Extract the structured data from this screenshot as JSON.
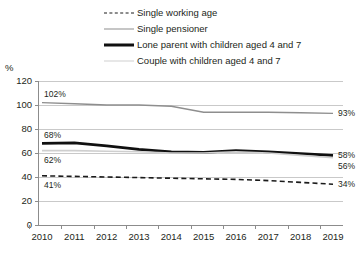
{
  "unit_label": "%",
  "legend": {
    "items": [
      {
        "label": "Single working age",
        "style": "dashed",
        "color": "#1b1b1b"
      },
      {
        "label": "Single pensioner",
        "style": "thin",
        "color": "#8e8e8e"
      },
      {
        "label": "Lone parent with children aged 4 and 7",
        "style": "thick",
        "color": "#101010"
      },
      {
        "label": "Couple with children aged 4 and 7",
        "style": "light",
        "color": "#cfcfcf"
      }
    ]
  },
  "axis": {
    "y_ticks": [
      "120",
      "100",
      "80",
      "60",
      "40",
      "20",
      "0"
    ],
    "x_ticks": [
      "2010",
      "2011",
      "2012",
      "2013",
      "2014",
      "2015",
      "2016",
      "2017",
      "2018",
      "2019"
    ]
  },
  "annotations": {
    "left": [
      {
        "text": "102%",
        "series": "Single pensioner"
      },
      {
        "text": "68%",
        "series": "Lone parent with children aged 4 and 7"
      },
      {
        "text": "62%",
        "series": "Couple with children aged 4 and 7"
      },
      {
        "text": "41%",
        "series": "Single working age"
      }
    ],
    "right": [
      {
        "text": "93%",
        "series": "Single pensioner"
      },
      {
        "text": "58%",
        "series": "Lone parent with children aged 4 and 7"
      },
      {
        "text": "56%",
        "series": "Couple with children aged 4 and 7"
      },
      {
        "text": "34%",
        "series": "Single working age"
      }
    ]
  },
  "chart_data": {
    "type": "line",
    "title": "",
    "xlabel": "",
    "ylabel": "%",
    "categories": [
      "2010",
      "2011",
      "2012",
      "2013",
      "2014",
      "2015",
      "2016",
      "2017",
      "2018",
      "2019"
    ],
    "ylim": [
      0,
      120
    ],
    "ytick_step": 20,
    "grid": "horizontal",
    "legend_position": "top",
    "series": [
      {
        "name": "Single working age",
        "style": "dashed",
        "color": "#1b1b1b",
        "width": 1.6,
        "values": [
          41,
          40.5,
          40,
          39.5,
          39,
          38.5,
          38,
          37,
          35.5,
          34
        ],
        "start_label": "41%",
        "end_label": "34%"
      },
      {
        "name": "Single pensioner",
        "style": "solid",
        "color": "#8e8e8e",
        "width": 1.4,
        "values": [
          102,
          101,
          100,
          100,
          99,
          94,
          94,
          94,
          93.5,
          93
        ],
        "start_label": "102%",
        "end_label": "93%"
      },
      {
        "name": "Lone parent with children aged 4 and 7",
        "style": "solid",
        "color": "#101010",
        "width": 2.8,
        "values": [
          68,
          68.5,
          66,
          63,
          61,
          60.5,
          62,
          61,
          59.5,
          58
        ],
        "start_label": "68%",
        "end_label": "58%"
      },
      {
        "name": "Couple with children aged 4 and 7",
        "style": "solid",
        "color": "#cfcfcf",
        "width": 1.6,
        "values": [
          62,
          62,
          61.5,
          61,
          60,
          60,
          61,
          60,
          58,
          56
        ],
        "start_label": "62%",
        "end_label": "56%"
      }
    ]
  }
}
